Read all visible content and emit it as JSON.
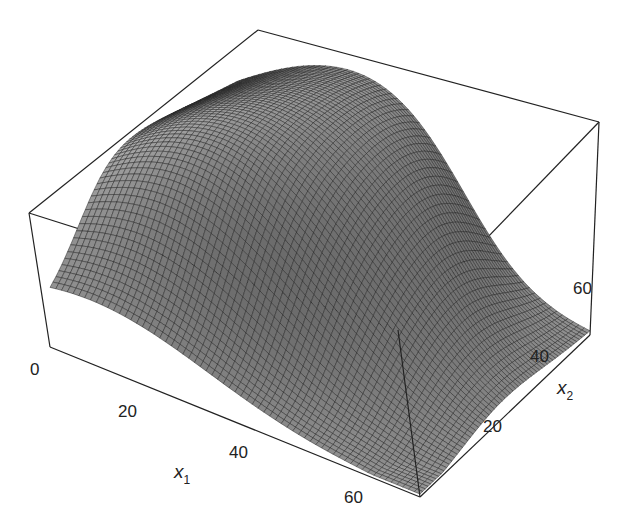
{
  "chart_data": {
    "type": "surface3d",
    "title": "",
    "xlabel": "x",
    "xlabel_sub": "1",
    "ylabel": "x",
    "ylabel_sub": "2",
    "zlabel": "",
    "x_ticks": [
      "0",
      "20",
      "40",
      "60"
    ],
    "y_ticks": [
      "20",
      "40",
      "60"
    ],
    "xlim": [
      0,
      65
    ],
    "ylim": [
      0,
      70
    ],
    "grid_resolution": 64,
    "box": true,
    "colors": {
      "surface": "#8a8a8a",
      "mesh": "#1a1a1a",
      "box": "#222222",
      "background": "#ffffff"
    }
  },
  "labels": {
    "x_ticks": [
      {
        "text": "0",
        "x": 30,
        "y": 375
      },
      {
        "text": "20",
        "x": 118,
        "y": 417
      },
      {
        "text": "40",
        "x": 229,
        "y": 458
      },
      {
        "text": "60",
        "x": 344,
        "y": 503
      }
    ],
    "y_ticks": [
      {
        "text": "20",
        "x": 483,
        "y": 432
      },
      {
        "text": "40",
        "x": 530,
        "y": 362
      },
      {
        "text": "60",
        "x": 573,
        "y": 294
      }
    ],
    "x_axis_label": {
      "text": "x",
      "sub": "1",
      "x": 174,
      "y": 478
    },
    "y_axis_label": {
      "text": "x",
      "sub": "2",
      "x": 557,
      "y": 394
    }
  }
}
